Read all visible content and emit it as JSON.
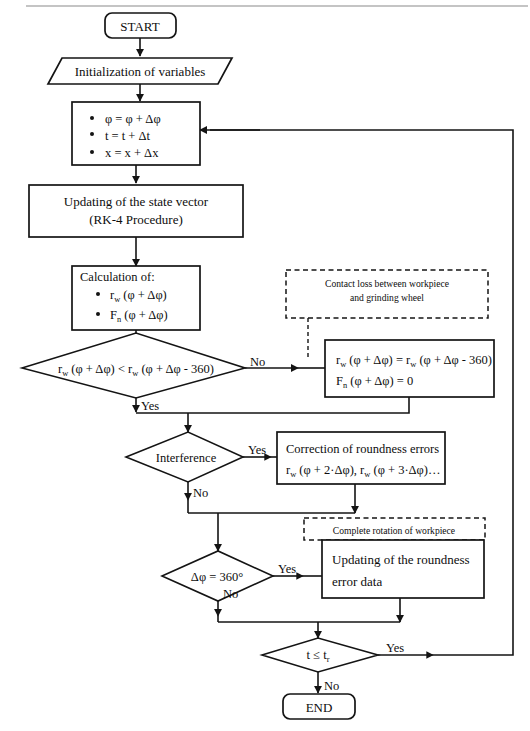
{
  "diagram": {
    "type": "flowchart"
  },
  "nodes": {
    "start": {
      "label": "START",
      "shape": "terminator"
    },
    "init": {
      "label": "Initialization of variables",
      "shape": "parallelogram"
    },
    "increment": {
      "shape": "process",
      "bullets": [
        "φ = φ + Δφ",
        "t = t + Δt",
        "x = x + Δx"
      ]
    },
    "state_vector": {
      "shape": "process",
      "line1": "Updating of the state vector",
      "line2": "(RK-4 Procedure)"
    },
    "calculation": {
      "shape": "process",
      "header": "Calculation of:",
      "bullets": [
        "rₙ (φ + Δφ)",
        "Fₙ (φ + Δφ)"
      ],
      "bullet1_main": "r",
      "bullet1_sub": "w",
      "bullet1_rest": " (φ + Δφ)",
      "bullet2_main": "F",
      "bullet2_sub": "n",
      "bullet2_rest": " (φ + Δφ)"
    },
    "contact_loss_note": {
      "shape": "dashed-annotation",
      "line1": "Contact loss between workpiece",
      "line2": "and grinding wheel"
    },
    "decision_rw": {
      "shape": "decision",
      "main": "r",
      "sub": "w",
      "rest": " (φ + Δφ) < r",
      "sub2": "w",
      "rest2": " (φ + Δφ - 360)"
    },
    "contact_loss_assign": {
      "shape": "process",
      "line1_main": "r",
      "line1_sub": "w",
      "line1_rest": " (φ + Δφ) = r",
      "line1_sub2": "w",
      "line1_rest2": " (φ + Δφ - 360)",
      "line2_main": "F",
      "line2_sub": "n",
      "line2_rest": " (φ + Δφ) = 0"
    },
    "decision_interference": {
      "shape": "decision",
      "label": "Interference"
    },
    "correction": {
      "shape": "process",
      "line1": "Correction of roundness errors",
      "line2_main": "r",
      "line2_sub": "w",
      "line2_rest": " (φ + 2·Δφ), r",
      "line2_sub2": "w",
      "line2_rest2": " (φ + 3·Δφ)…"
    },
    "complete_rotation_note": {
      "shape": "dashed-annotation",
      "label": "Complete rotation of workpiece"
    },
    "decision_phi": {
      "shape": "decision",
      "label": "Δφ = 360°"
    },
    "update_roundness": {
      "shape": "process",
      "line1": "Updating of the roundness",
      "line2": "error data"
    },
    "decision_time": {
      "shape": "decision",
      "main": "t ≤ t",
      "sub": "r"
    },
    "end": {
      "label": "END",
      "shape": "terminator"
    }
  },
  "edge_labels": {
    "rw_no": "No",
    "rw_yes": "Yes",
    "interference_yes": "Yes",
    "interference_no": "No",
    "phi_yes": "Yes",
    "phi_no": "No",
    "time_yes": "Yes",
    "time_no": "No"
  },
  "colors": {
    "stroke": "#141414",
    "background": "#ffffff",
    "text": "#0d0d0d",
    "top_rule": "#8a8a8a"
  }
}
